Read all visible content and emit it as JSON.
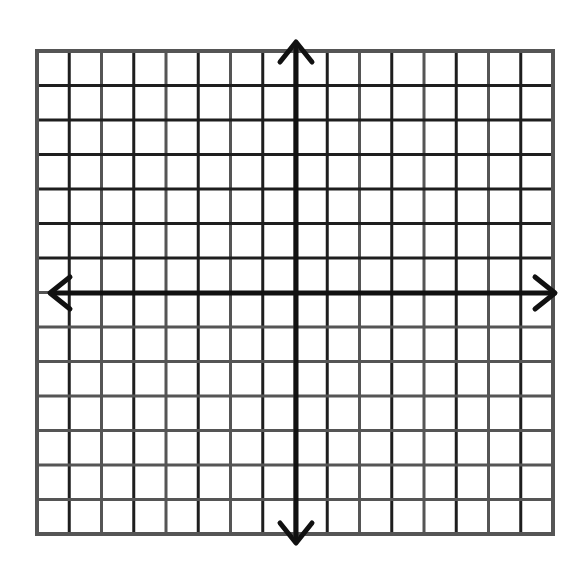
{
  "diagram": {
    "type": "coordinate-plane",
    "grid": {
      "columns": 16,
      "rows": 14,
      "columns_left_of_y_axis": 8,
      "columns_right_of_y_axis": 8,
      "rows_above_x_axis": 7,
      "rows_below_x_axis": 7,
      "left": 37,
      "top": 51,
      "right": 553,
      "bottom": 534,
      "line_color": "#555555",
      "line_color_dark": "#1e1e1e"
    },
    "axes": {
      "color": "#111111",
      "x_axis_y": 293,
      "y_axis_x": 296,
      "x_axis_extent": [
        50,
        555
      ],
      "y_axis_extent": [
        42,
        543
      ],
      "arrowheads": [
        "left",
        "right",
        "up",
        "down"
      ]
    },
    "labels": []
  }
}
